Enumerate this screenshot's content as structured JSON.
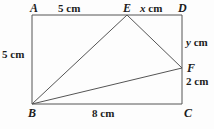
{
  "figure": {
    "type": "geometry-diagram",
    "shape": "rectangle-with-inscribed-triangle",
    "background_color": "#fdfdfd",
    "stroke_color": "#555555",
    "text_color": "#1c1c1c"
  },
  "vertices": [
    {
      "name": "A",
      "label": "A",
      "x": 32,
      "y": 15,
      "role": "rectangle-corner-top-left"
    },
    {
      "name": "D",
      "label": "D",
      "x": 182,
      "y": 15,
      "role": "rectangle-corner-top-right"
    },
    {
      "name": "C",
      "label": "C",
      "x": 182,
      "y": 104,
      "role": "rectangle-corner-bottom-right"
    },
    {
      "name": "B",
      "label": "B",
      "x": 32,
      "y": 104,
      "role": "rectangle-corner-bottom-left"
    },
    {
      "name": "E",
      "label": "E",
      "x": 127,
      "y": 15,
      "role": "point-on-top-edge"
    },
    {
      "name": "F",
      "label": "F",
      "x": 182,
      "y": 68,
      "role": "point-on-right-edge"
    }
  ],
  "segments": [
    {
      "name": "AD",
      "from": "A",
      "to": "D"
    },
    {
      "name": "DC",
      "from": "D",
      "to": "C"
    },
    {
      "name": "CB",
      "from": "C",
      "to": "B"
    },
    {
      "name": "BA",
      "from": "B",
      "to": "A"
    },
    {
      "name": "BE",
      "from": "B",
      "to": "E"
    },
    {
      "name": "EF",
      "from": "E",
      "to": "F"
    },
    {
      "name": "BF",
      "from": "B",
      "to": "F"
    }
  ],
  "measurements": {
    "ae": {
      "text": "5 cm",
      "value": 5,
      "unit": "cm",
      "segment": "AE"
    },
    "ed": {
      "text": "x cm",
      "value": "x",
      "unit": "cm",
      "segment": "ED"
    },
    "df": {
      "text": "y cm",
      "value": "y",
      "unit": "cm",
      "segment": "DF"
    },
    "fc": {
      "text": "2 cm",
      "value": 2,
      "unit": "cm",
      "segment": "FC"
    },
    "ab": {
      "text": "5 cm",
      "value": 5,
      "unit": "cm",
      "segment": "AB"
    },
    "bc": {
      "text": "8 cm",
      "value": 8,
      "unit": "cm",
      "segment": "BC"
    }
  },
  "labels": {
    "A": "A",
    "D": "D",
    "C": "C",
    "B": "B",
    "E": "E",
    "F": "F"
  }
}
